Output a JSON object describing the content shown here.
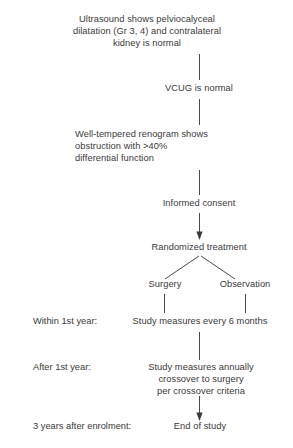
{
  "diagram": {
    "background_color": "#ffffff",
    "text_color": "#3a3a3a",
    "line_color": "#4a4a4a",
    "nodes": [
      {
        "id": "ultrasound",
        "text": "Ultrasound shows pelviocalyceal\ndilatation (Gr 3, 4) and contralateral\nkidney is normal"
      },
      {
        "id": "vcug",
        "text": "VCUG is normal"
      },
      {
        "id": "renogram",
        "text": "Well-tempered renogram shows\nobstruction with >40%\ndifferential function"
      },
      {
        "id": "consent",
        "text": "Informed consent"
      },
      {
        "id": "randomized",
        "text": "Randomized treatment"
      },
      {
        "id": "surgery",
        "text": "Surgery"
      },
      {
        "id": "observation",
        "text": "Observation"
      },
      {
        "id": "measures-6mo",
        "text": "Study measures every 6 months"
      },
      {
        "id": "measures-annual",
        "text": "Study measures annually\ncrossover to surgery\nper crossover criteria"
      },
      {
        "id": "end",
        "text": "End of study"
      }
    ],
    "stage_labels": [
      {
        "id": "within-1st-year",
        "text": "Within 1st year:"
      },
      {
        "id": "after-1st-year",
        "text": "After 1st year:"
      },
      {
        "id": "three-years",
        "text": "3 years after enrolment:"
      }
    ]
  }
}
